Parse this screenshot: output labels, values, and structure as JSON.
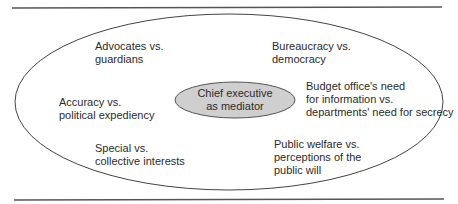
{
  "diagram": {
    "center": {
      "line1": "Chief executive",
      "line2": "as mediator",
      "fill": "#cfcfcf"
    },
    "tensions": [
      {
        "id": "advocates",
        "line1": "Advocates vs.",
        "line2": "guardians"
      },
      {
        "id": "bureaucracy",
        "line1": "Bureaucracy vs.",
        "line2": "democracy"
      },
      {
        "id": "accuracy",
        "line1": "Accuracy vs.",
        "line2": "political expediency"
      },
      {
        "id": "budget",
        "line1": "Budget office's need",
        "line2": "for information vs.",
        "line3": "departments' need for secrecy"
      },
      {
        "id": "special",
        "line1": "Special vs.",
        "line2": "collective interests"
      },
      {
        "id": "welfare",
        "line1": "Public welfare vs.",
        "line2": "perceptions of the",
        "line3": "public will"
      }
    ],
    "colors": {
      "rule": "#555555",
      "outline": "#444444"
    }
  }
}
